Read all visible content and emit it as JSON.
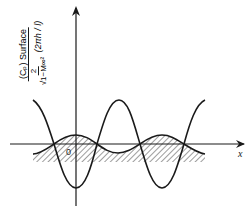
{
  "figure": {
    "y_axis_label": {
      "numerator": "(C_p) Surface",
      "numerator_text": "(Cₚ) Surface",
      "denominator_left": "2 / √(1−M∞²)",
      "denominator_num": "2",
      "denominator_den": "√1−M∞²",
      "denominator_paren": "(2πh / l)"
    },
    "origin_label": "0",
    "x_axis_label": "x",
    "colors": {
      "line": "#1a1a1a",
      "background": "#ffffff"
    },
    "curves": [
      {
        "name": "surface-pressure-curve",
        "description": "large amplitude cosine, minimum at origin"
      },
      {
        "name": "wall-shape-curve",
        "description": "small amplitude wavy wall, hatched below"
      }
    ]
  }
}
